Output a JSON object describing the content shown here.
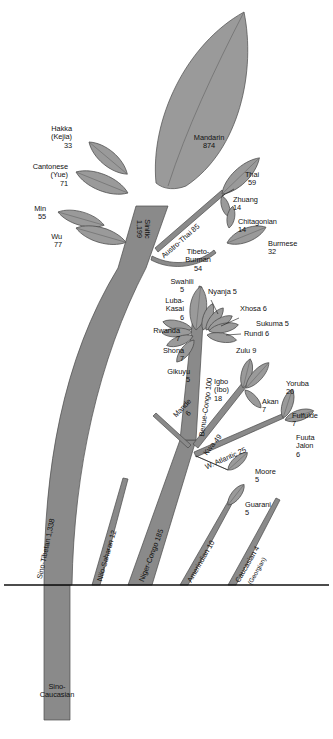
{
  "figure": {
    "type": "tree-diagram",
    "ground_line": true,
    "colors": {
      "trunk": "#8a8a8a",
      "leaf": "#9a9a9a",
      "outline": "#4a4a4a",
      "text": "#111111",
      "background": "#ffffff"
    }
  },
  "root": {
    "label": "Sino-\nCaucasian"
  },
  "trunks": [
    {
      "name": "sino-tibetan",
      "label": "Sino-Tibetan 1,338",
      "value": 1338
    },
    {
      "name": "nilo-saharan",
      "label": "Nilo-Saharan 12",
      "value": 12
    },
    {
      "name": "niger-congo",
      "label": "Niger-Congo 185",
      "value": 185
    },
    {
      "name": "amerindian",
      "label": "Amerindian 10",
      "value": 10
    },
    {
      "name": "caucasian",
      "label": "Caucasian 4",
      "sub": "(Georgian)",
      "value": 4
    }
  ],
  "branches": [
    {
      "name": "sinitic",
      "label": "Sinitic\n1,199",
      "value": 1199
    },
    {
      "name": "austro-thai",
      "label": "Austro-Thai 85",
      "value": 85
    },
    {
      "name": "tibeto-burman",
      "label": "Tibeto-\nBurman\n54",
      "value": 54
    },
    {
      "name": "benue-congo",
      "label": "Benue-Congo 100",
      "value": 100
    },
    {
      "name": "kwa",
      "label": "Kwa 49",
      "value": 49
    },
    {
      "name": "w-atlantic",
      "label": "W. Atlantic 25",
      "value": 25
    },
    {
      "name": "mande",
      "label": "Mande\n6",
      "value": 6
    }
  ],
  "leaves": [
    {
      "name": "mandarin",
      "label": "Mandarin\n874",
      "value": 874
    },
    {
      "name": "hakka",
      "label": "Hakka\n(Kejia)\n33",
      "value": 33
    },
    {
      "name": "cantonese",
      "label": "Cantonese\n(Yue)\n71",
      "value": 71
    },
    {
      "name": "min",
      "label": "Min\n55",
      "value": 55
    },
    {
      "name": "wu",
      "label": "Wu\n77",
      "value": 77
    },
    {
      "name": "thai",
      "label": "Thai\n59",
      "value": 59
    },
    {
      "name": "zhuang",
      "label": "Zhuang\n14",
      "value": 14
    },
    {
      "name": "chitagonian",
      "label": "Chitagonian\n14",
      "value": 14
    },
    {
      "name": "burmese",
      "label": "Burmese\n32",
      "value": 32
    },
    {
      "name": "swahili",
      "label": "Swahili\n5",
      "value": 5
    },
    {
      "name": "nyanja",
      "label": "Nyanja 5",
      "value": 5
    },
    {
      "name": "xhosa",
      "label": "Xhosa 6",
      "value": 6
    },
    {
      "name": "sukuma",
      "label": "Sukuma 5",
      "value": 5
    },
    {
      "name": "rundi",
      "label": "Rundi 6",
      "value": 6
    },
    {
      "name": "zulu",
      "label": "Zulu 9",
      "value": 9
    },
    {
      "name": "luba-kasai",
      "label": "Luba-\nKasai\n6",
      "value": 6
    },
    {
      "name": "rwanda",
      "label": "Rwanda\n7",
      "value": 7
    },
    {
      "name": "shona",
      "label": "Shona\n7",
      "value": 7
    },
    {
      "name": "gikuyu",
      "label": "Gikuyu\n5",
      "value": 5
    },
    {
      "name": "igbo",
      "label": "Igbo\n(Ibo)\n18",
      "value": 18
    },
    {
      "name": "yoruba",
      "label": "Yoruba\n20",
      "value": 20
    },
    {
      "name": "akan",
      "label": "Akan\n7",
      "value": 7
    },
    {
      "name": "fulfulde",
      "label": "Fulfulde\n7",
      "value": 7
    },
    {
      "name": "fuuta-jalon",
      "label": "Fuuta\nJalon\n6",
      "value": 6
    },
    {
      "name": "moore",
      "label": "Moore\n5",
      "value": 5
    },
    {
      "name": "guarani",
      "label": "Guarani\n5",
      "value": 5
    }
  ]
}
